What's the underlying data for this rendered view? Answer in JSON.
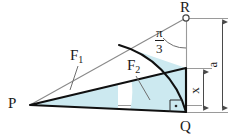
{
  "figure": {
    "type": "geometry-diagram",
    "canvas": {
      "width": 235,
      "height": 140
    },
    "colors": {
      "region_fill": "#cce9f0",
      "outline": "#101010",
      "thin_line": "#8f8f8f",
      "text": "#1a1a1a",
      "background": "#ffffff"
    },
    "points": [
      {
        "name": "P",
        "label": "P",
        "x": 30,
        "y": 105,
        "marker": "none"
      },
      {
        "name": "Q",
        "label": "Q",
        "x": 186,
        "y": 112,
        "marker": "none"
      },
      {
        "name": "R",
        "label": "R",
        "x": 186,
        "y": 18,
        "marker": "open-circle"
      }
    ],
    "point_labels": [
      {
        "name": "point-label-p",
        "text": "P",
        "x": 8,
        "y": 97
      },
      {
        "name": "point-label-q",
        "text": "Q",
        "x": 181,
        "y": 120
      },
      {
        "name": "point-label-r",
        "text": "R",
        "x": 181,
        "y": 1
      }
    ],
    "region_labels": [
      {
        "name": "region-label-f1",
        "base": "F",
        "subscript": "1",
        "x": 72,
        "y": 50
      },
      {
        "name": "region-label-f2",
        "base": "F",
        "subscript": "2",
        "x": 128,
        "y": 60
      }
    ],
    "angle": {
      "name": "angle-at-r",
      "numerator": "π",
      "denominator": "3",
      "label_x": 159,
      "label_y": 30,
      "vertex": "R"
    },
    "dimensions": [
      {
        "name": "dimension-a",
        "label": "a",
        "x": 212,
        "y": 60,
        "from_y": 18,
        "to_y": 112,
        "rotated": true
      },
      {
        "name": "dimension-x",
        "label": "x",
        "x": 193,
        "y": 88,
        "from_y": 68,
        "to_y": 112,
        "rotated": true
      }
    ]
  }
}
